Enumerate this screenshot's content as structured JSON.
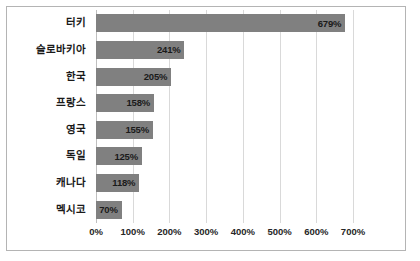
{
  "chart_data": {
    "type": "bar",
    "orientation": "horizontal",
    "title": "",
    "xlabel": "",
    "ylabel": "",
    "categories": [
      "터키",
      "슬로바키아",
      "한국",
      "프랑스",
      "영국",
      "독일",
      "캐나다",
      "멕시코"
    ],
    "values": [
      679,
      241,
      205,
      158,
      155,
      125,
      118,
      70
    ],
    "value_labels": [
      "679%",
      "241%",
      "205%",
      "158%",
      "155%",
      "125%",
      "118%",
      "70%"
    ],
    "xlim": [
      0,
      700
    ],
    "xticks": [
      0,
      100,
      200,
      300,
      400,
      500,
      600,
      700
    ],
    "xtick_labels": [
      "0%",
      "100%",
      "200%",
      "300%",
      "400%",
      "500%",
      "600%",
      "700%"
    ],
    "grid": true,
    "legend": null,
    "bar_color": "#808080",
    "gridline_color": "#d9d9d9",
    "border_color": "#b4b4b4",
    "label_color": "#1a1a1a"
  }
}
